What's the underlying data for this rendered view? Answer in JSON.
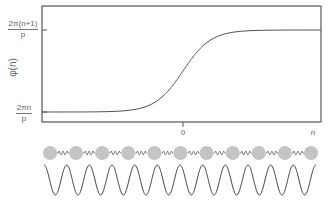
{
  "plot": {
    "y_axis_label": "φ(n)",
    "y_ticks": [
      {
        "numerator": "2π(n+1)",
        "denominator": "p"
      },
      {
        "numerator": "2πn",
        "denominator": "p"
      }
    ],
    "x_ticks": [
      "0",
      "n"
    ]
  },
  "chain": {
    "bead_count": 11,
    "bead_color": "#c4c4c4",
    "spring_color": "#666666"
  },
  "wave": {
    "periods": 12,
    "color": "#444444"
  },
  "chart_data": {
    "type": "line",
    "title": "",
    "xlabel": "n",
    "ylabel": "φ(n)",
    "x_tick_labels": [
      "0",
      "n"
    ],
    "y_tick_labels": [
      "2πn/p",
      "2π(n+1)/p"
    ],
    "series": [
      {
        "name": "φ(n) kink profile",
        "shape": "sigmoid step from 2πn/p to 2π(n+1)/p centered at 0"
      }
    ],
    "grid": false
  }
}
